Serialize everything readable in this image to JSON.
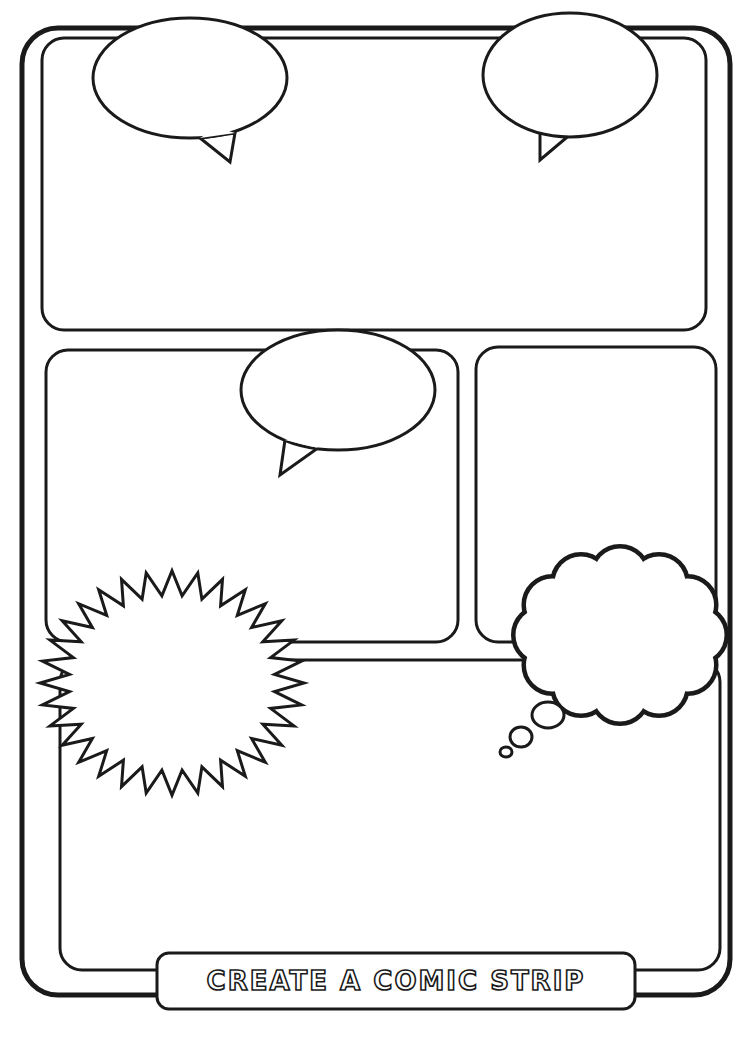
{
  "page": {
    "title": "CREATE A COMIC STRIP",
    "colors": {
      "ink": "#1a1a1a",
      "paper": "#ffffff"
    }
  },
  "panels": [
    {
      "id": "panel-top",
      "x": 42,
      "y": 38,
      "w": 664,
      "h": 292,
      "r": 22
    },
    {
      "id": "panel-middle-left",
      "x": 46,
      "y": 350,
      "w": 412,
      "h": 292,
      "r": 22
    },
    {
      "id": "panel-middle-right",
      "x": 476,
      "y": 347,
      "w": 240,
      "h": 295,
      "r": 22
    },
    {
      "id": "panel-bottom",
      "x": 60,
      "y": 660,
      "w": 660,
      "h": 310,
      "r": 22
    }
  ],
  "balloons": [
    {
      "id": "speech-top-left",
      "type": "speech",
      "cx": 190,
      "cy": 78,
      "rx": 97,
      "ry": 60,
      "tail": [
        [
          200,
          138
        ],
        [
          230,
          162
        ],
        [
          235,
          133
        ]
      ]
    },
    {
      "id": "speech-top-right",
      "type": "speech",
      "cx": 570,
      "cy": 75,
      "rx": 87,
      "ry": 62,
      "tail": [
        [
          540,
          126
        ],
        [
          540,
          160
        ],
        [
          572,
          133
        ]
      ]
    },
    {
      "id": "speech-middle",
      "type": "speech",
      "cx": 338,
      "cy": 390,
      "rx": 97,
      "ry": 60,
      "tail": [
        [
          285,
          440
        ],
        [
          280,
          475
        ],
        [
          318,
          448
        ]
      ]
    },
    {
      "id": "burst-bottom-left",
      "type": "burst",
      "cx": 172,
      "cy": 683,
      "r_outer": 132,
      "r_inner": 103,
      "points": 32,
      "sy": 0.85
    },
    {
      "id": "thought-bottom-right",
      "type": "thought",
      "cx": 620,
      "cy": 635,
      "rx": 100,
      "ry": 80,
      "bubbles": [
        [
          548,
          715,
          16,
          13
        ],
        [
          521,
          737,
          11,
          10
        ],
        [
          506,
          752,
          6,
          5
        ]
      ]
    }
  ]
}
